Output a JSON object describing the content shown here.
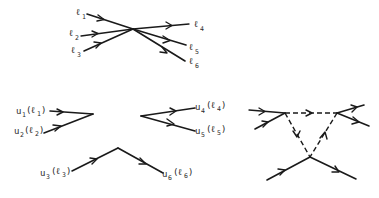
{
  "figure": {
    "type": "feynman-diagrams",
    "line_color": "#1a1a1a",
    "background": "#ffffff"
  },
  "top_vertex": {
    "description": "six-leg contact vertex",
    "incoming": [
      {
        "sym": "ℓ",
        "sub": "1"
      },
      {
        "sym": "ℓ",
        "sub": "2"
      },
      {
        "sym": "ℓ",
        "sub": "3"
      }
    ],
    "outgoing": [
      {
        "sym": "ℓ",
        "sub": "4"
      },
      {
        "sym": "ℓ",
        "sub": "5"
      },
      {
        "sym": "ℓ",
        "sub": "6"
      }
    ]
  },
  "split_vertices": {
    "left": [
      {
        "u": "u",
        "u_sub": "1",
        "l": "ℓ",
        "l_sub": "1"
      },
      {
        "u": "u",
        "u_sub": "2",
        "l": "ℓ",
        "l_sub": "2"
      }
    ],
    "right": [
      {
        "u": "u",
        "u_sub": "4",
        "l": "ℓ",
        "l_sub": "4"
      },
      {
        "u": "u",
        "u_sub": "5",
        "l": "ℓ",
        "l_sub": "5"
      }
    ],
    "bottom": [
      {
        "u": "u",
        "u_sub": "3",
        "l": "ℓ",
        "l_sub": "3"
      },
      {
        "u": "u",
        "u_sub": "6",
        "l": "ℓ",
        "l_sub": "6"
      }
    ]
  },
  "triangle_diagram": {
    "description": "three vertices joined by dashed internal lines forming a triangle",
    "external_lines": 6,
    "internal_dashed_lines": 3
  }
}
